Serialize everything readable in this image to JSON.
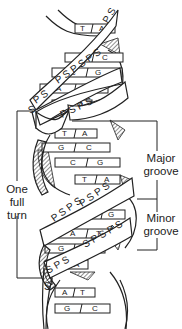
{
  "diagram": {
    "labels": {
      "one_full_turn": [
        "One",
        "full",
        "turn"
      ],
      "major_groove": [
        "Major",
        "groove"
      ],
      "minor_groove": [
        "Minor",
        "groove"
      ]
    },
    "backbone_text": "PSPSPS",
    "base_pairs": [
      {
        "left": "T",
        "right": "A",
        "y": 28
      },
      {
        "left": "G",
        "right": "C",
        "y": 58
      },
      {
        "left": "C",
        "right": "G",
        "y": 73
      },
      {
        "left": "A",
        "right": "T",
        "y": 89
      },
      {
        "left": "T",
        "right": "A",
        "y": 105
      },
      {
        "left": "T",
        "right": "A",
        "y": 134
      },
      {
        "left": "G",
        "right": "C",
        "y": 148
      },
      {
        "left": "C",
        "right": "G",
        "y": 163
      },
      {
        "left": "T",
        "right": "A",
        "y": 180
      },
      {
        "left": "C",
        "right": "G",
        "y": 215
      },
      {
        "left": "A",
        "right": "T",
        "y": 234
      },
      {
        "left": "G",
        "right": "C",
        "y": 249
      },
      {
        "left": "T",
        "right": "A",
        "y": 265
      },
      {
        "left": "A",
        "right": "T",
        "y": 293
      },
      {
        "left": "G",
        "right": "C",
        "y": 309
      }
    ],
    "colors": {
      "line": "#222222",
      "background": "#ffffff"
    }
  }
}
